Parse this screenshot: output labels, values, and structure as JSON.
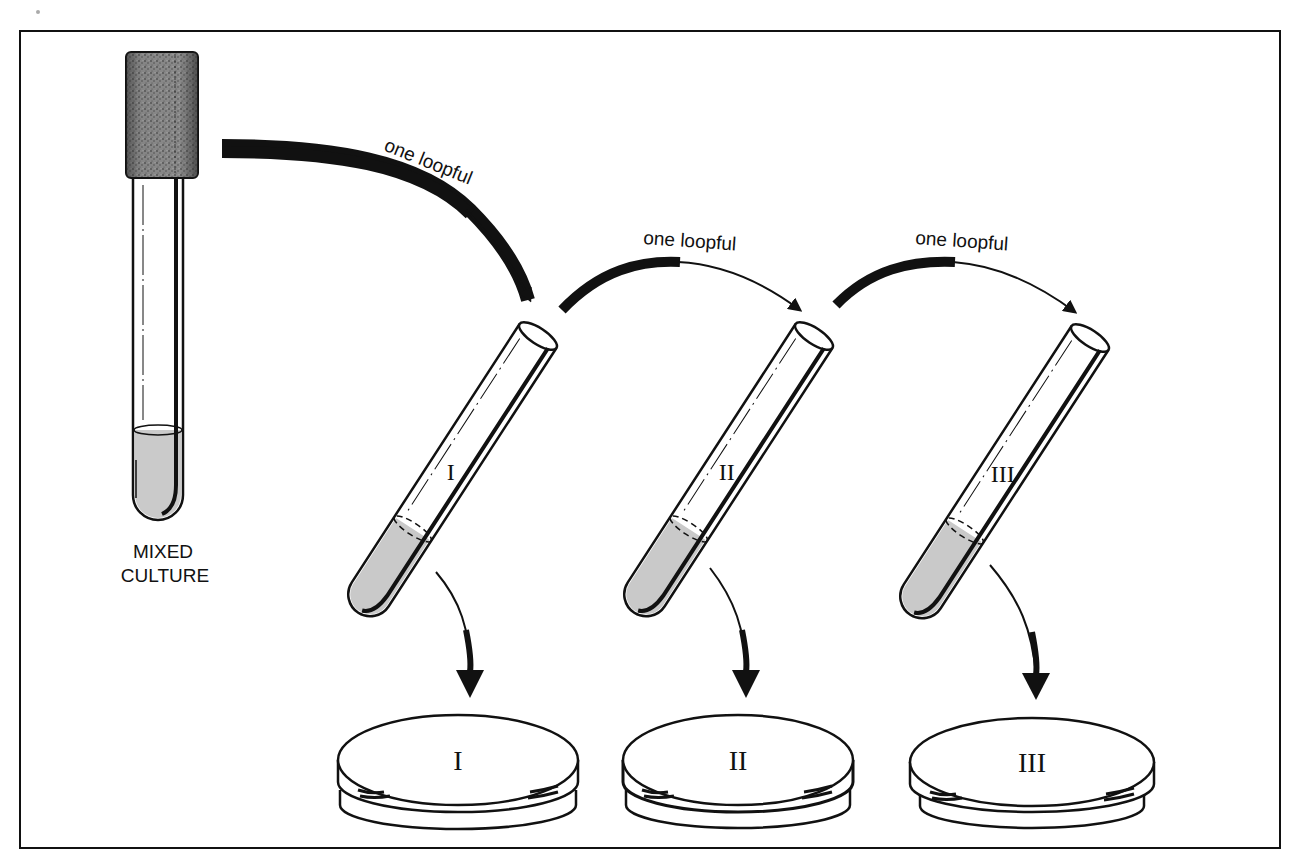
{
  "diagram": {
    "type": "serial-dilution-procedure",
    "colors": {
      "ink": "#111111",
      "liquid": "#c9c9c9",
      "stopper": "#8a8a8a",
      "background": "#ffffff"
    },
    "source": {
      "label_line1": "MIXED",
      "label_line2": "CULTURE"
    },
    "transfers": [
      {
        "label": "one loopful",
        "from": "source",
        "to": "tube-1"
      },
      {
        "label": "one loopful",
        "from": "tube-1",
        "to": "tube-2"
      },
      {
        "label": "one loopful",
        "from": "tube-2",
        "to": "tube-3"
      }
    ],
    "tubes": [
      {
        "id": "tube-1",
        "numeral": "I"
      },
      {
        "id": "tube-2",
        "numeral": "II"
      },
      {
        "id": "tube-3",
        "numeral": "III"
      }
    ],
    "plates": [
      {
        "id": "plate-1",
        "numeral": "I"
      },
      {
        "id": "plate-2",
        "numeral": "II"
      },
      {
        "id": "plate-3",
        "numeral": "III"
      }
    ]
  }
}
